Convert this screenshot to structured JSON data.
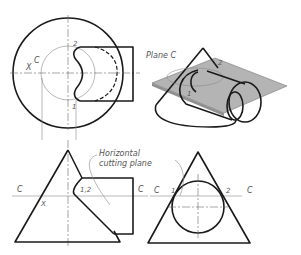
{
  "figure": {
    "top_view": {
      "labels": {
        "c": "C",
        "x": "X",
        "p1": "1",
        "p2": "2"
      }
    },
    "pictorial_view": {
      "plane_label": "Plane C",
      "point_labels": {
        "p1": "1",
        "p2": "2"
      },
      "plane_color": "#b0b0b0"
    },
    "front_view": {
      "annotation_line1": "Horizontal",
      "annotation_line2": "cutting plane",
      "labels": {
        "c_left": "C",
        "c_right": "C",
        "x": "X",
        "p12": "1,2"
      }
    },
    "side_view": {
      "labels": {
        "c_left": "C",
        "c_right": "C",
        "p1": "1",
        "p2": "2"
      }
    }
  }
}
